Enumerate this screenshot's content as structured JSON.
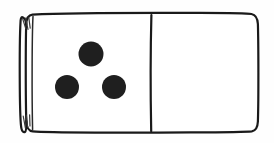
{
  "scene": {
    "title": "Domino Tile",
    "subject": "domino-tile",
    "orientation": "landscape",
    "style": "hand-drawn ink line art",
    "background_color": "#fefefe",
    "canvas": {
      "width": 274,
      "height": 143
    }
  },
  "domino": {
    "name": "domino-three-blank",
    "notation": "3-0",
    "pip_total": 3,
    "outline_color": "#1a1a1a",
    "face_color": "#ffffff",
    "pip_color": "#1f1f1f",
    "outline_width": 2.2,
    "body": {
      "x": 22,
      "y": 13,
      "width": 236,
      "height": 120,
      "corner_radius": 9
    },
    "spine": {
      "name": "left-edge-spine",
      "outer_x": 22,
      "inner_x": 33,
      "hatch_marks_top": 3,
      "hatch_marks_bottom": 3,
      "hatch_color": "#3a3a3a"
    },
    "divider": {
      "name": "center-divider",
      "x": 151,
      "top_y": 15,
      "bottom_y": 131
    },
    "halves": [
      {
        "name": "left-half",
        "position": "left",
        "pip_count": 3,
        "arrangement": "triangle",
        "label": "Three",
        "pips": [
          {
            "name": "pip-top-center",
            "cx": 91,
            "cy": 54,
            "r": 12.5
          },
          {
            "name": "pip-bottom-left",
            "cx": 67,
            "cy": 87,
            "r": 12.0
          },
          {
            "name": "pip-bottom-right",
            "cx": 114,
            "cy": 87,
            "r": 12.0
          }
        ]
      },
      {
        "name": "right-half",
        "position": "right",
        "pip_count": 0,
        "arrangement": "blank",
        "label": "Blank",
        "pips": []
      }
    ]
  }
}
